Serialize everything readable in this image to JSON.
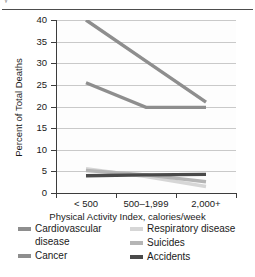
{
  "top_fragment": "y",
  "chart_data": {
    "type": "line",
    "title": "",
    "xlabel": "Physical Activity Index, calories/week",
    "ylabel": "Percent of Total Deaths",
    "categories": [
      "< 500",
      "500–1,999",
      "2,000+"
    ],
    "ylim": [
      0,
      40
    ],
    "ytick_values": [
      0,
      5,
      10,
      15,
      20,
      25,
      30,
      35,
      40
    ],
    "ytick_labels": [
      "0",
      "5",
      "10",
      "15",
      "20",
      "25",
      "30",
      "35",
      "40"
    ],
    "grid": true,
    "legend_position": "below",
    "series": [
      {
        "name": "Cardiovascular disease",
        "color": "#8e8e8e",
        "values": [
          40,
          30.5,
          21
        ],
        "clipped_at_top": true
      },
      {
        "name": "Cancer",
        "color": "#8e8e8e",
        "values": [
          25.5,
          19.8,
          19.8
        ]
      },
      {
        "name": "Respiratory disease",
        "color": "#d6d6d6",
        "values": [
          5.6,
          3.8,
          1.5
        ]
      },
      {
        "name": "Suicides",
        "color": "#b5b5b5",
        "values": [
          5.2,
          4.2,
          2.6
        ]
      },
      {
        "name": "Accidents",
        "color": "#4a4a4a",
        "values": [
          4.0,
          4.2,
          4.3
        ]
      }
    ]
  },
  "legend": {
    "columns": [
      {
        "items": [
          {
            "label": "Cardiovascular disease",
            "color": "#8e8e8e"
          },
          {
            "label": "Cancer",
            "color": "#8e8e8e"
          }
        ]
      },
      {
        "items": [
          {
            "label": "Respiratory disease",
            "color": "#d6d6d6"
          },
          {
            "label": "Suicides",
            "color": "#b5b5b5"
          },
          {
            "label": "Accidents",
            "color": "#4a4a4a"
          }
        ]
      }
    ]
  }
}
